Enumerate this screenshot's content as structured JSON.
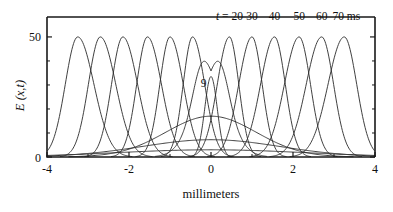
{
  "figure": {
    "xlabel": "millimeters",
    "ylabel": "E (x,t)",
    "time_label_prefix": "t =",
    "time_label_unit": "ms",
    "center_annotation": "9"
  },
  "axes": {
    "x_ticks": [
      {
        "value": -4,
        "label": "-4"
      },
      {
        "value": -2,
        "label": "-2"
      },
      {
        "value": 0,
        "label": "0"
      },
      {
        "value": 2,
        "label": "2"
      },
      {
        "value": 4,
        "label": "4"
      }
    ],
    "x_minor_ticks": [
      -3,
      -1,
      1,
      3
    ],
    "y_ticks": [
      {
        "value": 0,
        "label": "0"
      },
      {
        "value": 50,
        "label": "50"
      }
    ],
    "y_minor_ticks": [
      10,
      20,
      30,
      40
    ]
  },
  "chart_data": {
    "type": "line",
    "title": "",
    "xlabel": "millimeters",
    "ylabel": "E (x,t)",
    "xlim": [
      -4,
      4
    ],
    "ylim": [
      0,
      55
    ],
    "grid": false,
    "legend": "inline-annotations",
    "annotations": [
      {
        "text": "t = 20",
        "x": 0.45,
        "y": 57
      },
      {
        "text": "30",
        "x": 1.0,
        "y": 57
      },
      {
        "text": "40",
        "x": 1.55,
        "y": 57
      },
      {
        "text": "50",
        "x": 2.15,
        "y": 57
      },
      {
        "text": "60",
        "x": 2.7,
        "y": 57
      },
      {
        "text": "70 ms",
        "x": 3.3,
        "y": 57
      },
      {
        "text": "9",
        "x": -0.18,
        "y": 29
      }
    ],
    "series": [
      {
        "name": "t=20 ms right",
        "time_ms": 20,
        "peak_x": 0.45,
        "peak_y": 50,
        "half_width": 0.33,
        "direction": "right"
      },
      {
        "name": "t=30 ms right",
        "time_ms": 30,
        "peak_x": 1.0,
        "peak_y": 50,
        "half_width": 0.36,
        "direction": "right"
      },
      {
        "name": "t=40 ms right",
        "time_ms": 40,
        "peak_x": 1.55,
        "peak_y": 50,
        "half_width": 0.38,
        "direction": "right"
      },
      {
        "name": "t=50 ms right",
        "time_ms": 50,
        "peak_x": 2.15,
        "peak_y": 50,
        "half_width": 0.4,
        "direction": "right"
      },
      {
        "name": "t=60 ms right",
        "time_ms": 60,
        "peak_x": 2.7,
        "peak_y": 50,
        "half_width": 0.42,
        "direction": "right"
      },
      {
        "name": "t=70 ms right",
        "time_ms": 70,
        "peak_x": 3.25,
        "peak_y": 50,
        "half_width": 0.44,
        "direction": "right"
      },
      {
        "name": "t=20 ms left",
        "time_ms": 20,
        "peak_x": -0.45,
        "peak_y": 50,
        "half_width": 0.33,
        "direction": "left"
      },
      {
        "name": "t=30 ms left",
        "time_ms": 30,
        "peak_x": -1.0,
        "peak_y": 50,
        "half_width": 0.36,
        "direction": "left"
      },
      {
        "name": "t=40 ms left",
        "time_ms": 40,
        "peak_x": -1.55,
        "peak_y": 50,
        "half_width": 0.38,
        "direction": "left"
      },
      {
        "name": "t=50 ms left",
        "time_ms": 50,
        "peak_x": -2.15,
        "peak_y": 50,
        "half_width": 0.4,
        "direction": "left"
      },
      {
        "name": "t=60 ms left",
        "time_ms": 60,
        "peak_x": -2.7,
        "peak_y": 50,
        "half_width": 0.42,
        "direction": "left"
      },
      {
        "name": "t=70 ms left",
        "time_ms": 70,
        "peak_x": -3.25,
        "peak_y": 50,
        "half_width": 0.44,
        "direction": "left"
      },
      {
        "name": "split t=9 ms",
        "time_ms": 9,
        "peak_y": 43,
        "dip_y": 37,
        "humps_x": [
          -0.22,
          0.22
        ],
        "note": "central double-humped splitting pulse labeled 9"
      },
      {
        "name": "broad envelope 1",
        "peak_y": 17,
        "half_width": 1.5,
        "note": "broad low tail"
      },
      {
        "name": "broad envelope 2",
        "peak_y": 7,
        "half_width": 2.3,
        "note": "broader lower tail"
      },
      {
        "name": "broad envelope 3",
        "peak_y": 3,
        "half_width": 3.1,
        "note": "broadest lowest tail"
      }
    ]
  },
  "colors": {
    "curve": "#2a2a2a",
    "axis": "#1a1a1a",
    "background": "#ffffff"
  }
}
